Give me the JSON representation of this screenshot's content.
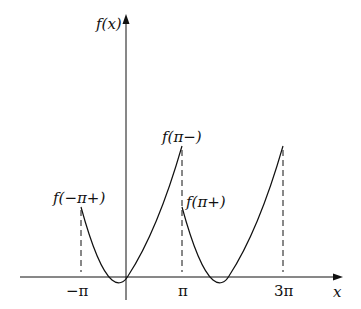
{
  "diagram": {
    "title": "",
    "y_axis_label": "f(x)",
    "x_axis_label": "x",
    "x_ticks": [
      "−π",
      "π",
      "3π"
    ],
    "annotations": {
      "left_start": "f(−π+)",
      "left_end": "f(π−)",
      "right_start": "f(π+)"
    }
  },
  "colors": {
    "stroke": "#111111",
    "background": "#ffffff"
  }
}
